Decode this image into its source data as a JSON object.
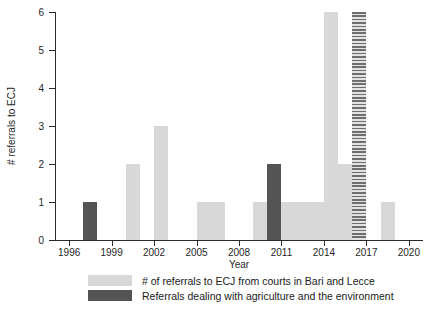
{
  "chart_data": {
    "type": "bar",
    "title": "",
    "xlabel": "Year",
    "ylabel": "# referrals to ECJ",
    "xlim": [
      1995,
      2021
    ],
    "ylim": [
      0,
      6
    ],
    "grid": false,
    "legend_position": "bottom",
    "x_tick_labels": [
      "1996",
      "1999",
      "2002",
      "2005",
      "2008",
      "2011",
      "2014",
      "2017",
      "2020"
    ],
    "x_tick_values": [
      1996,
      1999,
      2002,
      2005,
      2008,
      2011,
      2014,
      2017,
      2020
    ],
    "y_tick_labels": [
      "0",
      "1",
      "2",
      "3",
      "4",
      "5",
      "6"
    ],
    "y_tick_values": [
      0,
      1,
      2,
      3,
      4,
      5,
      6
    ],
    "categories": [
      1996,
      1997,
      1998,
      1999,
      2000,
      2001,
      2002,
      2003,
      2004,
      2005,
      2006,
      2007,
      2008,
      2009,
      2010,
      2011,
      2012,
      2013,
      2014,
      2015,
      2016,
      2017,
      2018,
      2019,
      2020
    ],
    "series": [
      {
        "name": "# of referrals to ECJ from courts in Bari and Lecce",
        "color": "#d8d8d8",
        "values": [
          0,
          0,
          0,
          0,
          2,
          0,
          3,
          0,
          0,
          1,
          1,
          0,
          0,
          1,
          0,
          1,
          1,
          1,
          6,
          2,
          6,
          0,
          1,
          0,
          0
        ]
      },
      {
        "name": "Referrals dealing with agriculture and the environment",
        "color": "#545454",
        "values": [
          0,
          1,
          0,
          0,
          0,
          0,
          0,
          0,
          0,
          0,
          0,
          0,
          0,
          0,
          2,
          0,
          0,
          0,
          0,
          0,
          0,
          0,
          0,
          0,
          0
        ]
      }
    ],
    "bars": [
      {
        "year": 1997,
        "value": 1,
        "style": "dark"
      },
      {
        "year": 2000,
        "value": 2,
        "style": "light"
      },
      {
        "year": 2002,
        "value": 3,
        "style": "light"
      },
      {
        "year": 2005,
        "value": 1,
        "style": "light"
      },
      {
        "year": 2006,
        "value": 1,
        "style": "light"
      },
      {
        "year": 2009,
        "value": 1,
        "style": "light"
      },
      {
        "year": 2010,
        "value": 2,
        "style": "dark"
      },
      {
        "year": 2011,
        "value": 1,
        "style": "light"
      },
      {
        "year": 2012,
        "value": 1,
        "style": "light"
      },
      {
        "year": 2013,
        "value": 1,
        "style": "light"
      },
      {
        "year": 2014,
        "value": 6,
        "style": "light"
      },
      {
        "year": 2015,
        "value": 2,
        "style": "light"
      },
      {
        "year": 2016,
        "value": 6,
        "style": "hatch"
      },
      {
        "year": 2018,
        "value": 1,
        "style": "light"
      }
    ],
    "legend": [
      {
        "label": "# of referrals to ECJ from courts in Bari and Lecce",
        "swatch": "light"
      },
      {
        "label": "Referrals dealing with agriculture and the environment",
        "swatch": "dark"
      }
    ],
    "colors": {
      "light_bar": "#d8d8d8",
      "dark_bar": "#545454",
      "hatch_bar": "#6e6e6e",
      "axis": "#2b2b2b",
      "text": "#1a1a1a",
      "background": "#ffffff"
    }
  }
}
